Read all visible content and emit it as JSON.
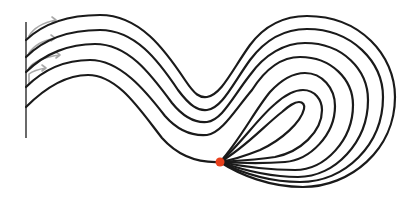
{
  "diagram": {
    "type": "streamline-flow",
    "colors": {
      "background": "#ffffff",
      "streamline": "#1a1a1a",
      "wall": "#444444",
      "arrow": "#a8a8a8",
      "sink_point": "#e8401c"
    },
    "wall": {
      "x": 26,
      "y1": 22,
      "y2": 138
    },
    "inflow_arrows": [
      {
        "d": "M29,36 Q36,24 56,20 L52,17 M56,20 L52,23"
      },
      {
        "d": "M29,53 Q36,42 55,38 L51,35 M55,38 L51,41"
      },
      {
        "d": "M29,68 Q36,58 60,55 L56,52 M60,55 L56,58"
      },
      {
        "d": "M29,84 L29,74 Q34,70 46,68 L42,65 M46,68 L42,71"
      }
    ],
    "streamlines": [
      {
        "name": "streamline-1",
        "d": "M26,40 C45,22 72,15 100,15 C140,15 165,50 185,80 C195,95 200,98 207,97 C222,94 232,70 250,45 C265,25 285,16 307,16 C360,16 395,55 395,97 C395,150 350,187 303,187 C270,187 240,175 220,162"
      },
      {
        "name": "streamline-2",
        "d": "M26,57 C45,38 72,30 100,30 C135,30 158,60 178,90 C190,106 198,111 207,110 C222,108 232,85 250,60 C265,40 285,29 307,29 C352,29 383,62 383,97 C383,145 345,182 300,182 C268,182 240,172 220,162"
      },
      {
        "name": "streamline-3",
        "d": "M26,72 C45,53 70,44 95,44 C128,44 150,73 172,103 C185,119 196,123 207,122 C222,120 232,98 250,75 C265,54 285,43 305,43 C343,43 368,70 368,100 C368,142 335,177 298,177 C266,177 240,169 220,162"
      },
      {
        "name": "streamline-4",
        "d": "M26,87 C45,68 68,60 90,60 C120,60 145,90 165,116 C180,133 194,136 207,135 C222,133 235,110 252,90 C266,68 283,57 300,57 C332,57 353,80 353,105 C353,140 325,170 295,170 C264,170 240,166 220,162"
      },
      {
        "name": "streamline-5",
        "d": "M26,107 C45,88 66,75 88,75 C118,75 140,110 162,138 C178,156 198,163 220,162"
      }
    ],
    "closed_loops": [
      {
        "name": "sink-loop-outer",
        "d": "M220,162 C240,140 255,110 270,92 C282,79 293,73 305,73 C322,73 335,88 335,106 C335,135 310,160 285,162 C260,164 238,163 220,162"
      },
      {
        "name": "sink-loop-middle",
        "d": "M220,162 C240,145 258,118 275,104 C285,95 294,90 303,90 C315,90 322,100 322,110 C322,132 300,152 275,157 C255,160 235,161 220,162"
      },
      {
        "name": "sink-loop-inner",
        "d": "M220,162 C245,148 265,125 282,112 C289,106 294,102 299,102 C303,102 305,105 304,109 C301,122 282,140 260,150 C245,156 232,160 220,162"
      }
    ],
    "sink_point": {
      "cx": 220,
      "cy": 162,
      "r": 4.5
    }
  }
}
